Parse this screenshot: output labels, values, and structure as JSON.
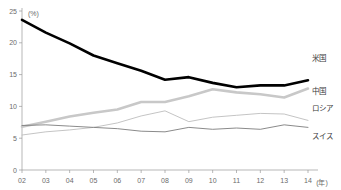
{
  "chart_data": {
    "type": "line",
    "title": "",
    "xlabel": "(年)",
    "ylabel": "(%)",
    "xlim": [
      2,
      14
    ],
    "ylim": [
      0,
      25
    ],
    "yticks": [
      0,
      5,
      10,
      15,
      20,
      25
    ],
    "ytick_labels": [
      "0",
      "5",
      "10",
      "15",
      "20",
      "25"
    ],
    "x": [
      2,
      3,
      4,
      5,
      6,
      7,
      8,
      9,
      10,
      11,
      12,
      13,
      14
    ],
    "categories": [
      "02",
      "03",
      "04",
      "05",
      "06",
      "07",
      "08",
      "09",
      "10",
      "11",
      "12",
      "13",
      "14"
    ],
    "grid": false,
    "legend_position": "right-inline",
    "series": [
      {
        "name": "米国",
        "color": "#000000",
        "width": 2.6,
        "values": [
          23.6,
          21.6,
          19.9,
          18.0,
          16.8,
          15.6,
          14.2,
          14.6,
          13.7,
          13.0,
          13.3,
          13.3,
          14.1
        ],
        "label_y": 15.9
      },
      {
        "name": "中国",
        "color": "#c8c8c8",
        "width": 2.6,
        "values": [
          6.8,
          7.6,
          8.4,
          9.0,
          9.5,
          10.7,
          10.7,
          11.6,
          12.7,
          12.2,
          11.9,
          11.4,
          12.8
        ],
        "label_y": 10.8
      },
      {
        "name": "ロシア",
        "color": "#bdbdbd",
        "width": 0.9,
        "values": [
          5.5,
          6.0,
          6.3,
          6.7,
          7.4,
          8.5,
          9.3,
          7.6,
          8.3,
          8.6,
          8.9,
          8.8,
          7.8
        ],
        "label_y": 8.4
      },
      {
        "name": "スイス",
        "color": "#7d7d7d",
        "width": 0.9,
        "values": [
          7.0,
          7.1,
          6.9,
          6.7,
          6.5,
          6.1,
          6.0,
          6.7,
          6.4,
          6.6,
          6.4,
          7.1,
          6.7
        ]
      }
    ],
    "series_labels": [
      {
        "name": "米国",
        "x": 312,
        "y": 61
      },
      {
        "name": "中国",
        "x": 312,
        "y": 94
      },
      {
        "name": "ロシア",
        "x": 312,
        "y": 111
      },
      {
        "name": "スイス",
        "x": 312,
        "y": 139
      }
    ]
  }
}
